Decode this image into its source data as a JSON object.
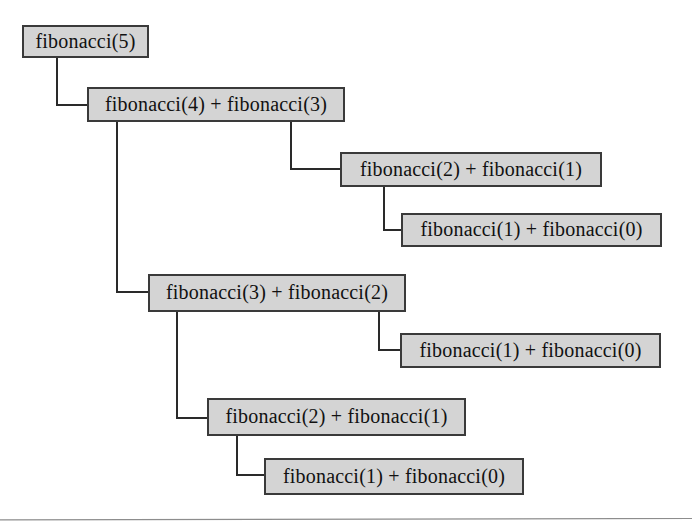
{
  "diagram": {
    "type": "recursion-tree",
    "background_color": "#ffffff",
    "node_fill_color": "#d4d4d4",
    "node_border_color": "#3a3a3a",
    "connector_color": "#2a2a2a",
    "text_color": "#111111",
    "nodes": [
      {
        "id": "n0",
        "label": "fibonacci(5)",
        "level": 0,
        "x": 22,
        "y": 25,
        "w": 127,
        "h": 33
      },
      {
        "id": "n1",
        "label": "fibonacci(4) + fibonacci(3)",
        "level": 1,
        "x": 87,
        "y": 87,
        "w": 258,
        "h": 35
      },
      {
        "id": "n2",
        "label": "fibonacci(2) + fibonacci(1)",
        "level": 2,
        "x": 340,
        "y": 152,
        "w": 262,
        "h": 35
      },
      {
        "id": "n3",
        "label": "fibonacci(1) + fibonacci(0)",
        "level": 3,
        "x": 401,
        "y": 213,
        "w": 261,
        "h": 34
      },
      {
        "id": "n4",
        "label": "fibonacci(3) + fibonacci(2)",
        "level": 2,
        "x": 148,
        "y": 274,
        "w": 258,
        "h": 38
      },
      {
        "id": "n5",
        "label": "fibonacci(1) + fibonacci(0)",
        "level": 3,
        "x": 400,
        "y": 333,
        "w": 261,
        "h": 35
      },
      {
        "id": "n6",
        "label": "fibonacci(2) + fibonacci(1)",
        "level": 3,
        "x": 207,
        "y": 398,
        "w": 259,
        "h": 38
      },
      {
        "id": "n7",
        "label": "fibonacci(1) + fibonacci(0)",
        "level": 4,
        "x": 264,
        "y": 458,
        "w": 260,
        "h": 37
      }
    ],
    "connectors": [
      {
        "id": "c0",
        "from": "n0",
        "to": "n1",
        "from_x": 57,
        "from_y": 58,
        "corner_y": 105,
        "to_x": 87
      },
      {
        "id": "c1",
        "from": "n1",
        "to": "n2",
        "from_x": 291,
        "from_y": 122,
        "corner_y": 169,
        "to_x": 340
      },
      {
        "id": "c2",
        "from": "n2",
        "to": "n3",
        "from_x": 384,
        "from_y": 187,
        "corner_y": 230,
        "to_x": 401
      },
      {
        "id": "c3",
        "from": "n1",
        "to": "n4",
        "from_x": 117,
        "from_y": 122,
        "corner_y": 292,
        "to_x": 148
      },
      {
        "id": "c4",
        "from": "n4",
        "to": "n5",
        "from_x": 379,
        "from_y": 312,
        "corner_y": 350,
        "to_x": 400
      },
      {
        "id": "c5",
        "from": "n4",
        "to": "n6",
        "from_x": 177,
        "from_y": 312,
        "corner_y": 418,
        "to_x": 207
      },
      {
        "id": "c6",
        "from": "n6",
        "to": "n7",
        "from_x": 237,
        "from_y": 436,
        "corner_y": 475,
        "to_x": 264
      }
    ],
    "bottom_rule": {
      "label": "horizontal-divider",
      "x1": 0,
      "y1": 2.6,
      "x2": 692,
      "y2": 0.6
    }
  }
}
